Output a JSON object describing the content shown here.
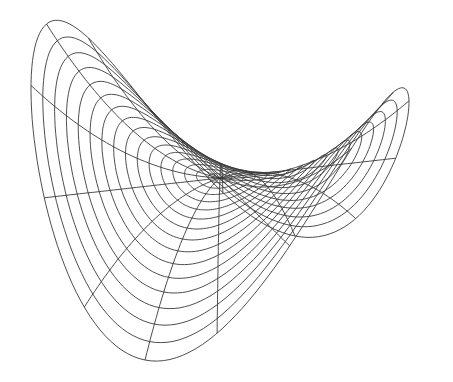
{
  "figure": {
    "surface": "z = r^2 cos(2θ)",
    "rings": 16,
    "spokes": 16,
    "line_color": "#3a3a3a",
    "background": "#ffffff",
    "projection": {
      "center": [
        220,
        178
      ],
      "x_vec": [
        -173.5,
        -34
      ],
      "y_vec": [
        -75,
        62
      ],
      "z_vec": [
        0,
        -120
      ]
    }
  }
}
